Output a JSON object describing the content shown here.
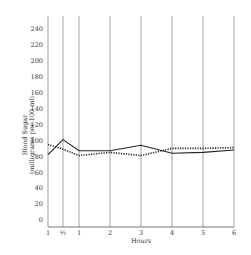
{
  "chart_data": {
    "type": "line",
    "title": "",
    "xlabel": "Hours",
    "ylabel": "Blood Sugar (milligrams per 100 ml)",
    "ylabel_lines": [
      "Blood Sugar",
      "(milligrams per 100 ml)"
    ],
    "x_tick_labels": [
      "1",
      "½",
      "1",
      "2",
      "3",
      "4",
      "5",
      "6"
    ],
    "x": [
      0,
      0.5,
      1,
      2,
      3,
      4,
      5,
      6
    ],
    "y_ticks": [
      0,
      20,
      40,
      60,
      80,
      100,
      120,
      140,
      160,
      180,
      200,
      220,
      240
    ],
    "ylim": [
      0,
      240
    ],
    "grid": "vertical lines at each x tick",
    "legend": "none",
    "series": [
      {
        "name": "solid line",
        "style": "solid",
        "values": [
          82,
          101,
          87,
          87,
          94,
          84,
          85,
          88
        ]
      },
      {
        "name": "dotted line",
        "style": "dotted",
        "values": [
          95,
          89,
          81,
          85,
          81,
          90,
          90,
          91
        ]
      }
    ]
  }
}
